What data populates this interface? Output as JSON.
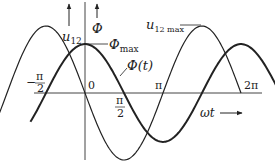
{
  "diagram": {
    "type": "waveform",
    "axis_x_label": "ωt",
    "curves": [
      {
        "name": "u12",
        "label": "u",
        "label_sub": "12",
        "phase_lead": "π/2",
        "relative_amplitude": 1.0,
        "range_periods": [
          -0.55,
          1.0
        ]
      },
      {
        "name": "phi",
        "label": "Φ(t)",
        "relative_amplitude": 0.73,
        "range_periods": [
          -0.35,
          1.3
        ]
      }
    ],
    "annotations": {
      "u12_axis_label": "u",
      "u12_axis_sub": "12",
      "phi_axis_label": "Φ",
      "phi_max_label": "Φ",
      "phi_max_sub": "max",
      "phi_t_label": "Φ(t)",
      "u12max_label": "u",
      "u12max_sub": "12 max"
    },
    "ticks": {
      "neg_half_pi_num": "π",
      "neg_half_pi_den": "2",
      "neg_sign": "−",
      "zero": "0",
      "half_pi_num": "π",
      "half_pi_den": "2",
      "pi": "π",
      "two_pi": "2π"
    },
    "colors": {
      "line": "#222222"
    }
  }
}
